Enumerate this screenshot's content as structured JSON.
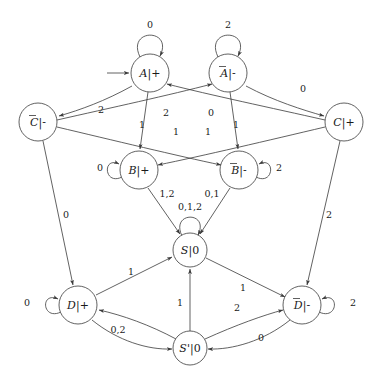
{
  "diagram": {
    "type": "finite-state-machine",
    "title": "",
    "start_state": "A",
    "nodes": [
      {
        "id": "A",
        "label": "A",
        "overbar": false,
        "output": "+",
        "display": "A|+",
        "cx": 150,
        "cy": 73,
        "r": 19
      },
      {
        "id": "Abar",
        "label": "A",
        "overbar": true,
        "output": "-",
        "display": "A̅|-",
        "cx": 228,
        "cy": 73,
        "r": 19
      },
      {
        "id": "Cbar",
        "label": "C",
        "overbar": true,
        "output": "-",
        "display": "C̅|-",
        "cx": 38,
        "cy": 122,
        "r": 19
      },
      {
        "id": "C",
        "label": "C",
        "overbar": false,
        "output": "+",
        "display": "C|+",
        "cx": 344,
        "cy": 122,
        "r": 19
      },
      {
        "id": "B",
        "label": "B",
        "overbar": false,
        "output": "+",
        "display": "B|+",
        "cx": 139,
        "cy": 170,
        "r": 19
      },
      {
        "id": "Bbar",
        "label": "B",
        "overbar": true,
        "output": "-",
        "display": "B̅|-",
        "cx": 239,
        "cy": 170,
        "r": 19
      },
      {
        "id": "S",
        "label": "S",
        "overbar": false,
        "output": "0",
        "display": "S|0",
        "cx": 190,
        "cy": 250,
        "r": 17
      },
      {
        "id": "D",
        "label": "D",
        "overbar": false,
        "output": "+",
        "display": "D|+",
        "cx": 78,
        "cy": 305,
        "r": 19
      },
      {
        "id": "Dbar",
        "label": "D",
        "overbar": true,
        "output": "-",
        "display": "D̅|-",
        "cx": 302,
        "cy": 305,
        "r": 19
      },
      {
        "id": "Sprime",
        "label": "S'",
        "overbar": false,
        "output": "0",
        "display": "S'|0",
        "cx": 190,
        "cy": 348,
        "r": 17
      }
    ],
    "edge_labels": [
      {
        "name": "loop-A",
        "text": "0",
        "from": "A",
        "to": "A",
        "x": 150,
        "y": 25
      },
      {
        "name": "loop-Abar",
        "text": "2",
        "from": "Abar",
        "to": "Abar",
        "x": 228,
        "y": 25
      },
      {
        "name": "Cbar-to-A",
        "text": "2",
        "from": "Cbar",
        "to": "A",
        "x": 101,
        "y": 110
      },
      {
        "name": "Abar-to-C",
        "text": "0",
        "from": "Abar",
        "to": "C",
        "x": 303,
        "y": 89
      },
      {
        "name": "A-to-B",
        "text": "1",
        "from": "A",
        "to": "B",
        "x": 142,
        "y": 125
      },
      {
        "name": "Cbar-to-Abar",
        "text": "2",
        "from": "Cbar",
        "to": "Abar",
        "x": 166,
        "y": 113
      },
      {
        "name": "C-to-A",
        "text": "0",
        "from": "C",
        "to": "A",
        "x": 211,
        "y": 113
      },
      {
        "name": "Abar-to-Bbar",
        "text": "1",
        "from": "Abar",
        "to": "Bbar",
        "x": 236,
        "y": 125
      },
      {
        "name": "C-to-B",
        "text": "1",
        "from": "C",
        "to": "B",
        "x": 176,
        "y": 132
      },
      {
        "name": "Cbar-to-Bbar",
        "text": "1",
        "from": "Cbar",
        "to": "Bbar",
        "x": 208,
        "y": 132
      },
      {
        "name": "loop-B",
        "text": "0",
        "from": "B",
        "to": "B",
        "x": 100,
        "y": 168
      },
      {
        "name": "loop-Bbar",
        "text": "2",
        "from": "Bbar",
        "to": "Bbar",
        "x": 279,
        "y": 168
      },
      {
        "name": "B-to-S",
        "text": "1,2",
        "from": "B",
        "to": "S",
        "x": 167,
        "y": 194
      },
      {
        "name": "Bbar-to-S",
        "text": "0,1",
        "from": "Bbar",
        "to": "S",
        "x": 212,
        "y": 194
      },
      {
        "name": "loop-S",
        "text": "0,1,2",
        "from": "S",
        "to": "S",
        "x": 190,
        "y": 207
      },
      {
        "name": "Cbar-to-D",
        "text": "0",
        "from": "Cbar",
        "to": "D",
        "x": 66,
        "y": 215
      },
      {
        "name": "C-to-Dbar",
        "text": "2",
        "from": "C",
        "to": "Dbar",
        "x": 329,
        "y": 215
      },
      {
        "name": "D-to-S",
        "text": "1",
        "from": "D",
        "to": "S",
        "x": 131,
        "y": 272
      },
      {
        "name": "loop-D",
        "text": "0",
        "from": "D",
        "to": "D",
        "x": 27,
        "y": 303
      },
      {
        "name": "loop-Dbar",
        "text": "2",
        "from": "Dbar",
        "to": "Dbar",
        "x": 353,
        "y": 303
      },
      {
        "name": "Sprime-to-S",
        "text": "1",
        "from": "Sprime",
        "to": "S",
        "x": 180,
        "y": 303
      },
      {
        "name": "S-to-Dbar",
        "text": "1",
        "from": "S",
        "to": "Dbar",
        "x": 243,
        "y": 288
      },
      {
        "name": "Sprime-to-Dbar",
        "text": "2",
        "from": "Sprime",
        "to": "Dbar",
        "x": 237,
        "y": 308
      },
      {
        "name": "Sprime-to-D",
        "text": "0,2",
        "from": "Sprime",
        "to": "D",
        "x": 118,
        "y": 330
      },
      {
        "name": "Dbar-to-Sprime",
        "text": "0",
        "from": "Dbar",
        "to": "Sprime",
        "x": 261,
        "y": 338
      }
    ]
  }
}
